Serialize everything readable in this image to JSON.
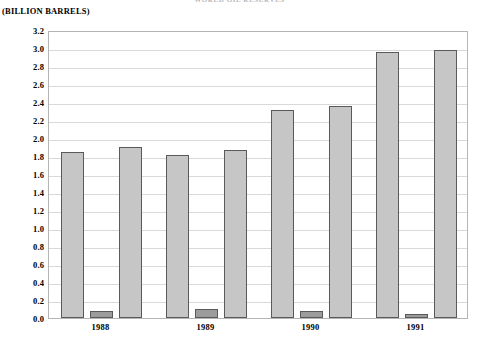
{
  "chart_data": {
    "type": "bar",
    "title": "WORLD OIL RESERVES",
    "subtitle": "",
    "xlabel": "",
    "ylabel": "(BILLION BARRELS)",
    "unit_caption": "(BILLION BARRELS)",
    "categories": [
      "1988",
      "1989",
      "1990",
      "1991"
    ],
    "series": [
      {
        "name": "series-1",
        "color": "#c6c6c6",
        "values": [
          1.84,
          1.81,
          2.31,
          2.96
        ]
      },
      {
        "name": "series-2",
        "color": "#9c9c9c",
        "values": [
          0.08,
          0.1,
          0.08,
          0.05
        ]
      },
      {
        "name": "series-3",
        "color": "#c6c6c6",
        "values": [
          1.9,
          1.87,
          2.36,
          2.98
        ]
      }
    ],
    "ylim": [
      0.0,
      3.2
    ],
    "ytick_step": 0.2,
    "ytick_labels": [
      "3.2",
      "3.0",
      "2.8",
      "2.6",
      "2.4",
      "2.2",
      "2.0",
      "1.8",
      "1.6",
      "1.4",
      "1.2",
      "1.0",
      "0.8",
      "0.6",
      "0.4",
      "0.2",
      "0.0"
    ],
    "grid": true,
    "legend": "none",
    "legend_position": "none",
    "bar_border_color": "#5a5a5a",
    "gridline_color": "#d9d9d9",
    "frame_color": "#b5b5b5",
    "background_color": "#ffffff"
  }
}
